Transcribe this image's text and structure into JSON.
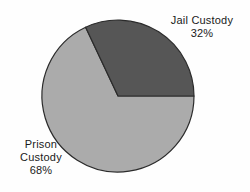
{
  "chart_data": {
    "type": "pie",
    "title": "",
    "categories": [
      "Jail Custody",
      "Prison Custody"
    ],
    "values": [
      32,
      68
    ],
    "value_labels": [
      "32%",
      "68%"
    ],
    "unit": "percent",
    "total": 100,
    "legend": "none",
    "grid": false,
    "slices": [
      {
        "label": "Jail Custody",
        "value": 32,
        "value_label": "32%",
        "color": "#565656",
        "start_angle_deg": 0,
        "end_angle_deg": 115.2
      },
      {
        "label": "Prison Custody",
        "value": 68,
        "value_label": "68%",
        "color": "#ababab",
        "start_angle_deg": 115.2,
        "end_angle_deg": 360
      }
    ]
  },
  "labels": {
    "jail": {
      "name": "Jail Custody",
      "percent": "32%"
    },
    "prison": {
      "name_line1": "Prison",
      "name_line2": "Custody",
      "percent": "68%"
    }
  },
  "colors": {
    "background": "#fefefe",
    "jail_slice": "#565656",
    "prison_slice": "#ababab",
    "slice_outline": "#2b2b2b",
    "text": "#1a1a1a"
  }
}
